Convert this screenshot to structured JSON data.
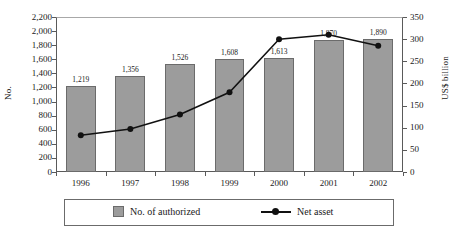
{
  "chart_data": {
    "type": "bar",
    "title": "",
    "xlabel": "",
    "ylabel": "No.",
    "y2label": "US$ billion",
    "categories": [
      "1996",
      "1997",
      "1998",
      "1999",
      "2000",
      "2001",
      "2002"
    ],
    "ylim": [
      0,
      2200
    ],
    "y2lim": [
      0,
      350
    ],
    "yticks": [
      "0",
      "200",
      "400",
      "600",
      "800",
      "1,000",
      "1,200",
      "1,400",
      "1,600",
      "1,800",
      "2,000",
      "2,200"
    ],
    "y2ticks": [
      "0",
      "50",
      "100",
      "150",
      "200",
      "250",
      "300",
      "350"
    ],
    "grid": false,
    "legend_position": "bottom",
    "series": [
      {
        "name": "No. of authorized",
        "type": "bar",
        "axis": "left",
        "color": "#9c9c9c",
        "values": [
          1219,
          1356,
          1526,
          1608,
          1613,
          1870,
          1890
        ],
        "labels": [
          "1,219",
          "1,356",
          "1,526",
          "1,608",
          "1,613",
          "1,870",
          "1,890"
        ]
      },
      {
        "name": "Net asset",
        "type": "line",
        "axis": "right",
        "color": "#111111",
        "values": [
          83,
          97,
          130,
          180,
          300,
          310,
          285
        ]
      }
    ]
  },
  "legend": {
    "bar_label": "No. of authorized",
    "line_label": "Net asset"
  }
}
